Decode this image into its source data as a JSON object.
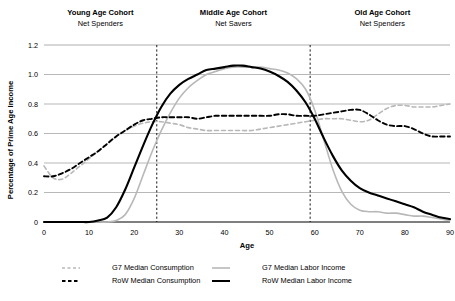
{
  "chart_data": {
    "type": "line",
    "title": "",
    "xlabel": "Age",
    "ylabel": "Percentage of Prime Age Income",
    "xlim": [
      0,
      90
    ],
    "ylim": [
      0,
      1.2
    ],
    "xticks": [
      "0",
      "10",
      "20",
      "30",
      "40",
      "50",
      "60",
      "70",
      "80",
      "90"
    ],
    "yticks": [
      "0",
      "0.2",
      "0.4",
      "0.6",
      "0.8",
      "1.0",
      "1.2"
    ],
    "grid": "horizontal",
    "legend_position": "bottom",
    "x": [
      0,
      2,
      4,
      6,
      8,
      10,
      12,
      14,
      16,
      18,
      20,
      22,
      24,
      26,
      28,
      30,
      32,
      34,
      36,
      38,
      40,
      42,
      44,
      46,
      48,
      50,
      52,
      54,
      56,
      58,
      60,
      62,
      64,
      66,
      68,
      70,
      72,
      74,
      76,
      78,
      80,
      82,
      84,
      86,
      88,
      90
    ],
    "series": [
      {
        "name": "G7 Median Consumption",
        "color": "#b8b8b8",
        "style": "dashed",
        "width": 1.6,
        "values": [
          0.38,
          0.3,
          0.29,
          0.33,
          0.38,
          0.43,
          0.48,
          0.53,
          0.58,
          0.62,
          0.65,
          0.67,
          0.68,
          0.68,
          0.67,
          0.66,
          0.64,
          0.63,
          0.62,
          0.62,
          0.62,
          0.62,
          0.62,
          0.62,
          0.63,
          0.64,
          0.65,
          0.66,
          0.67,
          0.68,
          0.69,
          0.7,
          0.7,
          0.7,
          0.69,
          0.68,
          0.69,
          0.73,
          0.77,
          0.79,
          0.79,
          0.78,
          0.78,
          0.78,
          0.79,
          0.8
        ]
      },
      {
        "name": "RoW Median Consumption",
        "color": "#000000",
        "style": "dashed",
        "width": 1.9,
        "values": [
          0.31,
          0.31,
          0.33,
          0.36,
          0.4,
          0.44,
          0.48,
          0.53,
          0.58,
          0.62,
          0.66,
          0.69,
          0.7,
          0.71,
          0.71,
          0.71,
          0.71,
          0.7,
          0.71,
          0.72,
          0.72,
          0.72,
          0.72,
          0.72,
          0.72,
          0.72,
          0.73,
          0.73,
          0.72,
          0.72,
          0.72,
          0.73,
          0.74,
          0.75,
          0.76,
          0.76,
          0.73,
          0.69,
          0.66,
          0.65,
          0.65,
          0.63,
          0.6,
          0.58,
          0.58,
          0.58
        ]
      },
      {
        "name": "G7 Median Labor Income",
        "color": "#b8b8b8",
        "style": "solid",
        "width": 1.6,
        "values": [
          0.0,
          0.0,
          0.0,
          0.0,
          0.0,
          0.0,
          0.0,
          0.0,
          0.01,
          0.05,
          0.16,
          0.32,
          0.48,
          0.62,
          0.74,
          0.84,
          0.91,
          0.96,
          1.0,
          1.02,
          1.04,
          1.05,
          1.05,
          1.05,
          1.05,
          1.04,
          1.03,
          1.01,
          0.97,
          0.9,
          0.76,
          0.56,
          0.36,
          0.21,
          0.12,
          0.08,
          0.07,
          0.07,
          0.06,
          0.06,
          0.05,
          0.04,
          0.04,
          0.03,
          0.02,
          0.01
        ]
      },
      {
        "name": "RoW Median Labor Income",
        "color": "#000000",
        "style": "solid",
        "width": 2.1,
        "values": [
          0.0,
          0.0,
          0.0,
          0.0,
          0.0,
          0.0,
          0.01,
          0.03,
          0.1,
          0.22,
          0.37,
          0.52,
          0.66,
          0.78,
          0.87,
          0.93,
          0.97,
          1.0,
          1.03,
          1.04,
          1.05,
          1.06,
          1.06,
          1.05,
          1.04,
          1.02,
          0.99,
          0.95,
          0.89,
          0.81,
          0.7,
          0.57,
          0.45,
          0.35,
          0.28,
          0.23,
          0.2,
          0.18,
          0.16,
          0.14,
          0.12,
          0.1,
          0.07,
          0.05,
          0.03,
          0.02
        ]
      }
    ],
    "annotations": [
      {
        "title": "Young Age Cohort",
        "subtitle": "Net Spenders",
        "x_center": 12.5
      },
      {
        "title": "Middle Age Cohort",
        "subtitle": "Net Savers",
        "x_center": 42
      },
      {
        "title": "Old Age Cohort",
        "subtitle": "Net Spenders",
        "x_center": 75
      }
    ],
    "dividers": [
      25,
      59
    ]
  },
  "legend": {
    "entries": [
      {
        "label": "G7 Median Consumption",
        "color": "#b8b8b8",
        "style": "dashed"
      },
      {
        "label": "G7 Median Labor Income",
        "color": "#b8b8b8",
        "style": "solid"
      },
      {
        "label": "RoW Median Consumption",
        "color": "#000000",
        "style": "dashed"
      },
      {
        "label": "RoW Median Labor Income",
        "color": "#000000",
        "style": "solid"
      }
    ]
  }
}
